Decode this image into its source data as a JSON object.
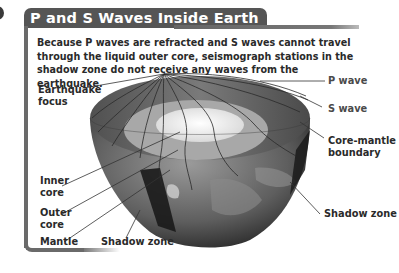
{
  "panel": {
    "title": "P and S Waves Inside Earth",
    "caption": "Because P waves are refracted and S waves cannot travel through the liquid outer core, seismograph stations in the shadow zone do not receive any waves from the earthquake."
  },
  "diagram": {
    "labels": {
      "earthquake_focus_line1": "Earthquake",
      "earthquake_focus_line2": "focus",
      "p_wave": "P wave",
      "s_wave": "S wave",
      "core_mantle_line1": "Core-mantle",
      "core_mantle_line2": "boundary",
      "inner_core_line1": "Inner",
      "inner_core_line2": "core",
      "outer_core_line1": "Outer",
      "outer_core_line2": "core",
      "mantle": "Mantle",
      "shadow_zone_bottom": "Shadow zone",
      "shadow_zone_right": "Shadow zone"
    },
    "colors": {
      "title_tab": "#555555",
      "frame": "#6a6a6a",
      "mantle": "#6e6e6e",
      "outer_core": "#a9a9a9",
      "inner_core": "#e6e6e6",
      "shadow_zone": "#1e1e1e"
    }
  }
}
